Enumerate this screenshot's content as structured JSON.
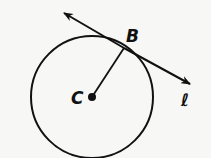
{
  "diagram": {
    "labels": {
      "center": "C",
      "tangent_point": "B",
      "line": "ℓ"
    },
    "colors": {
      "stroke": "#111111",
      "background": "#f7f7f5"
    },
    "circle": {
      "cx": 92,
      "cy": 97,
      "r": 61
    },
    "radius_segment": {
      "from": "C",
      "to": "B"
    },
    "tangent_line": {
      "name": "ℓ",
      "through": "B",
      "arrows": "both"
    }
  }
}
